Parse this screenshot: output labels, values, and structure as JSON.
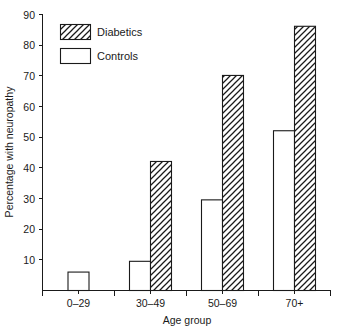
{
  "chart_data": {
    "type": "bar",
    "title": "",
    "xlabel": "Age group",
    "ylabel": "Percentage with neuropathy",
    "categories": [
      "0–29",
      "30–49",
      "50–69",
      "70+"
    ],
    "series": [
      {
        "name": "Controls",
        "values": [
          6,
          9.5,
          29.5,
          52
        ]
      },
      {
        "name": "Diabetics",
        "values": [
          null,
          42,
          70,
          86
        ]
      }
    ],
    "ylim": [
      0,
      90
    ],
    "yticks": [
      0,
      10,
      20,
      30,
      40,
      50,
      60,
      70,
      80,
      90
    ],
    "ytick_labels": [
      "",
      "10",
      "20",
      "30",
      "40",
      "50",
      "60",
      "70",
      "80",
      "90"
    ],
    "grid": false,
    "legend_position": "top-left",
    "legend": [
      {
        "label": "Diabetics",
        "fill": "hatch-diagonal"
      },
      {
        "label": "Controls",
        "fill": "white"
      }
    ],
    "colors": {
      "ink": "#1a1a1a",
      "background": "#ffffff",
      "controls_fill": "#ffffff",
      "diabetics_fill": "#ffffff",
      "hatch_stroke": "#1a1a1a"
    }
  },
  "axis": {
    "y_title": "Percentage with neuropathy",
    "x_title": "Age group",
    "y_tick_90": "90",
    "y_tick_80": "80",
    "y_tick_70": "70",
    "y_tick_60": "60",
    "y_tick_50": "50",
    "y_tick_40": "40",
    "y_tick_30": "30",
    "y_tick_20": "20",
    "y_tick_10": "10",
    "x_cat_0": "0–29",
    "x_cat_1": "30–49",
    "x_cat_2": "50–69",
    "x_cat_3": "70+"
  },
  "legend": {
    "diabetics_label": "Diabetics",
    "controls_label": "Controls"
  }
}
